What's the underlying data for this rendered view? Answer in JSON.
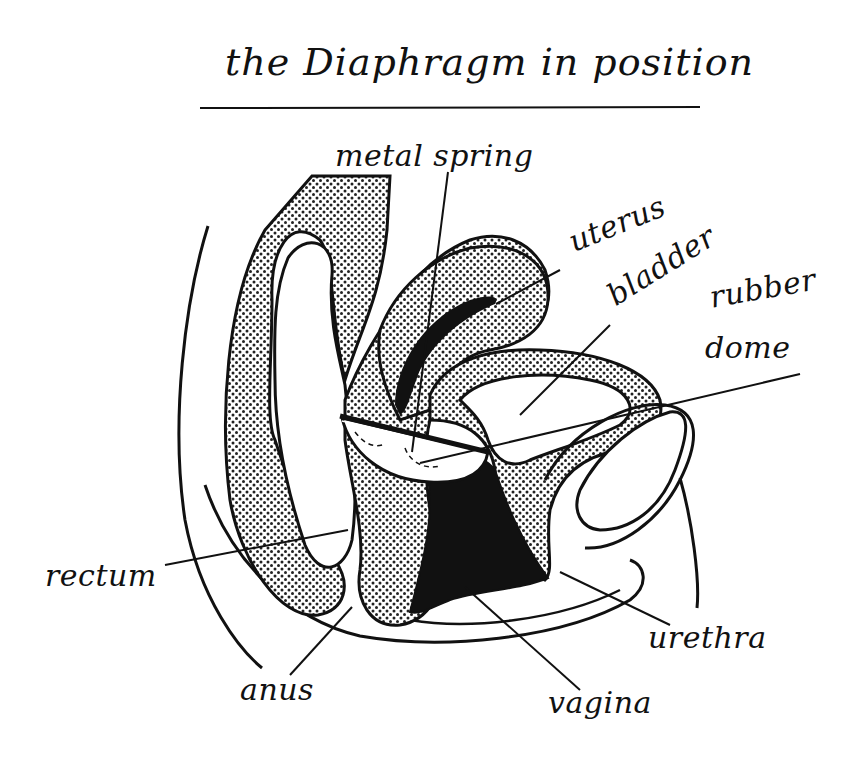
{
  "diagram": {
    "title": "the Diaphragm in position",
    "labels": {
      "metal_spring": "metal spring",
      "uterus": "uterus",
      "bladder": "bladder",
      "rubber_dome_line1": "rubber",
      "rubber_dome_line2": "dome",
      "rectum": "rectum",
      "anus": "anus",
      "vagina": "vagina",
      "urethra": "urethra"
    },
    "colors": {
      "ink": "#111111",
      "background": "#ffffff",
      "stipple": "#222222"
    }
  }
}
